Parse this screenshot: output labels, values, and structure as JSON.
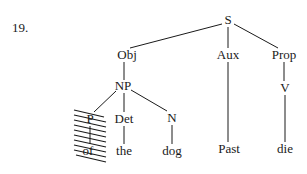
{
  "example_number": "19.",
  "tree": {
    "nodes": {
      "S": "S",
      "Obj": "Obj",
      "Aux": "Aux",
      "Prop": "Prop",
      "NP": "NP",
      "V": "V",
      "P": "P",
      "Det": "Det",
      "N": "N",
      "of": "of",
      "the": "the",
      "dog": "dog",
      "Past": "Past",
      "die": "die"
    },
    "edges": [
      [
        "S",
        "Obj"
      ],
      [
        "S",
        "Aux"
      ],
      [
        "S",
        "Prop"
      ],
      [
        "Obj",
        "NP"
      ],
      [
        "Prop",
        "V"
      ],
      [
        "NP",
        "P"
      ],
      [
        "NP",
        "Det"
      ],
      [
        "NP",
        "N"
      ],
      [
        "P",
        "of"
      ],
      [
        "Det",
        "the"
      ],
      [
        "N",
        "dog"
      ],
      [
        "Aux",
        "Past"
      ],
      [
        "V",
        "die"
      ]
    ],
    "struck_out_subtree": [
      "P",
      "of"
    ]
  }
}
